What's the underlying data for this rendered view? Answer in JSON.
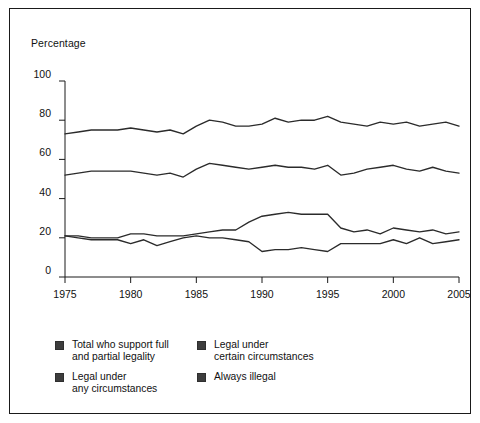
{
  "figure": {
    "axis_title": "Percentage",
    "border_color": "#1a1a1a",
    "line_color": "#2b2b2b",
    "swatch_color": "#3d3d3d"
  },
  "legend": {
    "items": [
      {
        "label": "Total who support full\nand partial legality",
        "swatch": "legend-swatch-total-support"
      },
      {
        "label": "Legal under\ncertain circumstances",
        "swatch": "legend-swatch-certain-circumstances"
      },
      {
        "label": "Legal under\nany circumstances",
        "swatch": "legend-swatch-any-circumstances"
      },
      {
        "label": "Always illegal",
        "swatch": "legend-swatch-always-illegal"
      }
    ]
  },
  "chart_data": {
    "type": "line",
    "title": "",
    "xlabel": "",
    "ylabel": "Percentage",
    "xlim": [
      1975,
      2005
    ],
    "ylim": [
      0,
      100
    ],
    "yticks": [
      0,
      20,
      40,
      60,
      80,
      100
    ],
    "xticks": [
      1975,
      1980,
      1985,
      1990,
      1995,
      2000,
      2005
    ],
    "grid": false,
    "legend_position": "below-left",
    "x": [
      1975,
      1976,
      1977,
      1978,
      1979,
      1980,
      1981,
      1982,
      1983,
      1984,
      1985,
      1986,
      1987,
      1988,
      1989,
      1990,
      1991,
      1992,
      1993,
      1994,
      1995,
      1996,
      1997,
      1998,
      1999,
      2000,
      2001,
      2002,
      2003,
      2004,
      2005
    ],
    "series": [
      {
        "name": "Total who support full and partial legality",
        "values": [
          73,
          74,
          75,
          75,
          75,
          76,
          75,
          74,
          75,
          73,
          77,
          80,
          79,
          77,
          77,
          78,
          81,
          79,
          80,
          80,
          82,
          79,
          78,
          77,
          79,
          78,
          79,
          77,
          78,
          79,
          77
        ]
      },
      {
        "name": "Legal under certain circumstances",
        "values": [
          52,
          53,
          54,
          54,
          54,
          54,
          53,
          52,
          53,
          51,
          55,
          58,
          57,
          56,
          55,
          56,
          57,
          56,
          56,
          55,
          57,
          52,
          53,
          55,
          56,
          57,
          55,
          54,
          56,
          54,
          53
        ]
      },
      {
        "name": "Legal under any circumstances",
        "values": [
          21,
          21,
          20,
          20,
          20,
          22,
          22,
          21,
          21,
          21,
          22,
          23,
          24,
          24,
          28,
          31,
          32,
          33,
          32,
          32,
          32,
          25,
          23,
          24,
          22,
          25,
          24,
          23,
          24,
          22,
          23
        ]
      },
      {
        "name": "Always illegal",
        "values": [
          21,
          20,
          19,
          19,
          19,
          17,
          19,
          16,
          18,
          20,
          21,
          20,
          20,
          19,
          18,
          13,
          14,
          14,
          15,
          14,
          13,
          17,
          17,
          17,
          17,
          19,
          17,
          20,
          17,
          18,
          19
        ]
      }
    ]
  }
}
